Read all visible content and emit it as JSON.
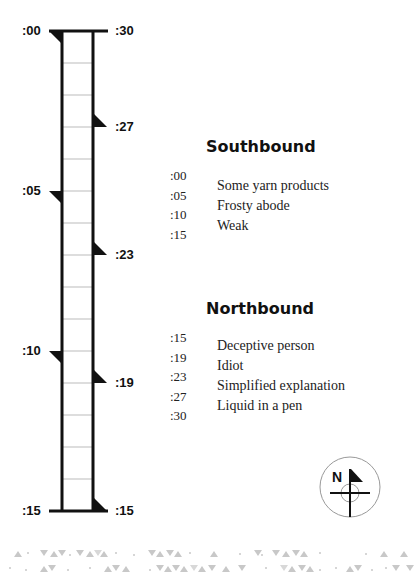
{
  "ladder": {
    "left_labels": [
      {
        "label": ":00",
        "y": 31
      },
      {
        "label": ":05",
        "y": 191
      },
      {
        "label": ":10",
        "y": 351
      },
      {
        "label": ":15",
        "y": 511
      }
    ],
    "right_labels": [
      {
        "label": ":30",
        "y": 31
      },
      {
        "label": ":27",
        "y": 127
      },
      {
        "label": ":23",
        "y": 255
      },
      {
        "label": ":19",
        "y": 383
      },
      {
        "label": ":15",
        "y": 511
      }
    ]
  },
  "southbound": {
    "title": "Southbound",
    "times": [
      ":00",
      ":05",
      ":10",
      ":15"
    ],
    "clues": [
      "Some yarn products",
      "Frosty abode",
      "Weak"
    ]
  },
  "northbound": {
    "title": "Northbound",
    "times": [
      ":15",
      ":19",
      ":23",
      ":27",
      ":30"
    ],
    "clues": [
      "Deceptive person",
      "Idiot",
      "Simplified explanation",
      "Liquid in a pen"
    ]
  },
  "compass": {
    "label": "N"
  },
  "colors": {
    "ink": "#111111",
    "tick": "#bbbbbb",
    "pattern": "#c8c8c8"
  }
}
